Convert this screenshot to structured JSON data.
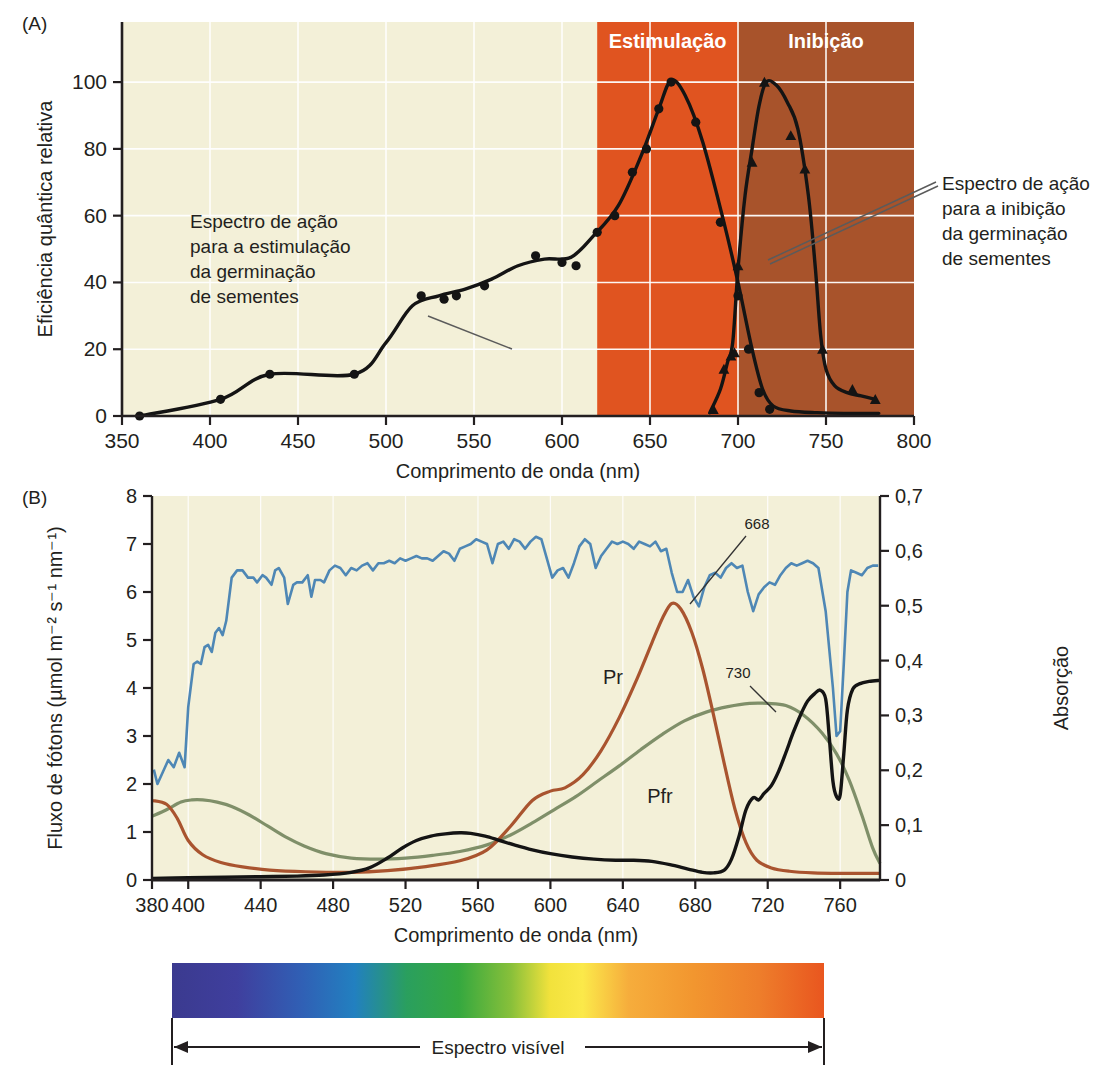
{
  "panelA": {
    "tag": "(A)",
    "ylabel": "Eficiência quântica relativa",
    "xlabel": "Comprimento de onda  (nm)",
    "xticks": [
      350,
      400,
      450,
      500,
      550,
      600,
      650,
      700,
      750,
      800
    ],
    "yticks": [
      0,
      20,
      40,
      60,
      80,
      100
    ],
    "xlim": [
      350,
      800
    ],
    "ylim": [
      0,
      118
    ],
    "bands": [
      {
        "label": "Estimulação",
        "from": 620,
        "to": 700,
        "color": "#e05420"
      },
      {
        "label": "Inibição",
        "from": 700,
        "to": 800,
        "color": "#a8532b"
      }
    ],
    "annotation_left": "Espectro de ação\npara a estimulação\nda germinação\nde sementes",
    "annotation_right": "Espectro de ação\npara a inibição\nda germinação\nde sementes",
    "stimulation_points": [
      [
        360,
        0
      ],
      [
        406,
        5
      ],
      [
        434,
        12.5
      ],
      [
        482,
        12.5
      ],
      [
        520,
        36
      ],
      [
        533,
        35
      ],
      [
        540,
        36
      ],
      [
        556,
        39
      ],
      [
        585,
        48
      ],
      [
        600,
        46
      ],
      [
        608,
        45
      ],
      [
        620,
        55
      ],
      [
        630,
        60
      ],
      [
        640,
        73
      ],
      [
        648,
        80
      ],
      [
        655,
        92
      ],
      [
        662,
        100
      ],
      [
        676,
        88
      ],
      [
        690,
        58
      ],
      [
        700,
        36
      ],
      [
        706,
        20
      ],
      [
        712,
        7
      ],
      [
        718,
        2
      ]
    ],
    "stimulation_curve": [
      [
        360,
        0
      ],
      [
        406,
        5
      ],
      [
        434,
        12.5
      ],
      [
        482,
        12.5
      ],
      [
        500,
        22
      ],
      [
        515,
        33
      ],
      [
        530,
        36
      ],
      [
        545,
        38
      ],
      [
        560,
        41
      ],
      [
        575,
        45
      ],
      [
        590,
        47
      ],
      [
        605,
        47.5
      ],
      [
        618,
        54
      ],
      [
        632,
        63
      ],
      [
        645,
        78
      ],
      [
        655,
        92
      ],
      [
        662,
        100.5
      ],
      [
        670,
        96
      ],
      [
        680,
        82
      ],
      [
        692,
        58
      ],
      [
        700,
        40
      ],
      [
        708,
        20
      ],
      [
        714,
        8
      ],
      [
        720,
        3
      ],
      [
        730,
        1.5
      ],
      [
        745,
        1
      ],
      [
        760,
        0.8
      ],
      [
        780,
        0.8
      ]
    ],
    "inhibition_points": [
      [
        686,
        2
      ],
      [
        692,
        14
      ],
      [
        696,
        18
      ],
      [
        698,
        19
      ],
      [
        700,
        45
      ],
      [
        708,
        76
      ],
      [
        715,
        100
      ],
      [
        730,
        84
      ],
      [
        738,
        74
      ],
      [
        748,
        20
      ],
      [
        765,
        8
      ],
      [
        778,
        5
      ]
    ],
    "inhibition_curve": [
      [
        684,
        1
      ],
      [
        690,
        8
      ],
      [
        694,
        16
      ],
      [
        697,
        22
      ],
      [
        700,
        44
      ],
      [
        704,
        66
      ],
      [
        708,
        80
      ],
      [
        712,
        93
      ],
      [
        716,
        100
      ],
      [
        722,
        99
      ],
      [
        728,
        94
      ],
      [
        734,
        86
      ],
      [
        740,
        66
      ],
      [
        744,
        44
      ],
      [
        747,
        24
      ],
      [
        750,
        14
      ],
      [
        755,
        9
      ],
      [
        762,
        7
      ],
      [
        770,
        6
      ],
      [
        778,
        5
      ]
    ]
  },
  "panelB": {
    "tag": "(B)",
    "ylabel_left": "Fluxo de fótons (µmol m⁻² s⁻¹ nm⁻¹)",
    "ylabel_right": "Absorção",
    "xlabel": "Comprimento de onda (nm)",
    "xticks": [
      380,
      400,
      440,
      480,
      520,
      560,
      600,
      640,
      680,
      720,
      760
    ],
    "xticks_labeled": [
      380,
      400,
      440,
      480,
      520,
      560,
      600,
      640,
      680,
      720,
      760
    ],
    "yticks_left": [
      0,
      1,
      2,
      3,
      4,
      5,
      6,
      7,
      8
    ],
    "yticks_right": [
      "0",
      "0,1",
      "0,2",
      "0,3",
      "0,4",
      "0,5",
      "0,6",
      "0,7"
    ],
    "xlim": [
      380,
      782
    ],
    "ylim_left": [
      0,
      8
    ],
    "ylim_right": [
      0,
      0.7
    ],
    "series_labels": {
      "pr": "Pr",
      "pfr": "Pfr"
    },
    "peak_labels": {
      "pr_peak": "668",
      "pfr_peak": "730"
    },
    "colors": {
      "sunlight": "#4e87b5",
      "pr": "#a9542f",
      "pfr": "#7f8f69",
      "black": "#141414"
    },
    "sunlight": [
      [
        381,
        2.3
      ],
      [
        383,
        2.0
      ],
      [
        386,
        2.25
      ],
      [
        389,
        2.5
      ],
      [
        392,
        2.35
      ],
      [
        395,
        2.65
      ],
      [
        398,
        2.35
      ],
      [
        400,
        3.6
      ],
      [
        403,
        4.5
      ],
      [
        405,
        4.55
      ],
      [
        407,
        4.5
      ],
      [
        409,
        4.85
      ],
      [
        411,
        4.9
      ],
      [
        413,
        4.75
      ],
      [
        415,
        5.15
      ],
      [
        417,
        5.25
      ],
      [
        419,
        5.1
      ],
      [
        421,
        5.4
      ],
      [
        424,
        6.3
      ],
      [
        427,
        6.45
      ],
      [
        430,
        6.45
      ],
      [
        433,
        6.3
      ],
      [
        436,
        6.3
      ],
      [
        438,
        6.2
      ],
      [
        441,
        6.35
      ],
      [
        443,
        6.3
      ],
      [
        446,
        6.15
      ],
      [
        448,
        6.45
      ],
      [
        450,
        6.5
      ],
      [
        453,
        6.3
      ],
      [
        455,
        5.75
      ],
      [
        458,
        6.15
      ],
      [
        460,
        6.2
      ],
      [
        463,
        6.2
      ],
      [
        466,
        6.35
      ],
      [
        468,
        5.9
      ],
      [
        470,
        6.25
      ],
      [
        473,
        6.25
      ],
      [
        475,
        6.2
      ],
      [
        478,
        6.45
      ],
      [
        481,
        6.55
      ],
      [
        484,
        6.5
      ],
      [
        487,
        6.35
      ],
      [
        490,
        6.5
      ],
      [
        493,
        6.45
      ],
      [
        496,
        6.55
      ],
      [
        499,
        6.6
      ],
      [
        502,
        6.45
      ],
      [
        505,
        6.6
      ],
      [
        508,
        6.6
      ],
      [
        511,
        6.65
      ],
      [
        514,
        6.6
      ],
      [
        517,
        6.7
      ],
      [
        520,
        6.65
      ],
      [
        523,
        6.7
      ],
      [
        526,
        6.75
      ],
      [
        529,
        6.7
      ],
      [
        532,
        6.7
      ],
      [
        535,
        6.65
      ],
      [
        538,
        6.75
      ],
      [
        541,
        6.85
      ],
      [
        544,
        6.8
      ],
      [
        547,
        6.65
      ],
      [
        550,
        6.9
      ],
      [
        553,
        6.95
      ],
      [
        556,
        7.0
      ],
      [
        559,
        7.1
      ],
      [
        562,
        7.05
      ],
      [
        565,
        7.0
      ],
      [
        568,
        6.6
      ],
      [
        571,
        7.0
      ],
      [
        574,
        7.05
      ],
      [
        577,
        6.9
      ],
      [
        580,
        7.1
      ],
      [
        583,
        7.05
      ],
      [
        586,
        6.9
      ],
      [
        589,
        7.05
      ],
      [
        592,
        7.15
      ],
      [
        595,
        7.1
      ],
      [
        598,
        6.7
      ],
      [
        601,
        6.3
      ],
      [
        604,
        6.45
      ],
      [
        607,
        6.5
      ],
      [
        610,
        6.3
      ],
      [
        613,
        6.6
      ],
      [
        616,
        6.95
      ],
      [
        619,
        7.1
      ],
      [
        622,
        7.0
      ],
      [
        625,
        6.5
      ],
      [
        628,
        6.75
      ],
      [
        631,
        6.9
      ],
      [
        634,
        7.05
      ],
      [
        637,
        7.0
      ],
      [
        640,
        7.05
      ],
      [
        643,
        7.0
      ],
      [
        646,
        6.9
      ],
      [
        649,
        7.05
      ],
      [
        652,
        7.0
      ],
      [
        655,
        6.95
      ],
      [
        658,
        7.05
      ],
      [
        661,
        6.85
      ],
      [
        664,
        6.9
      ],
      [
        667,
        6.4
      ],
      [
        670,
        6.0
      ],
      [
        673,
        6.0
      ],
      [
        676,
        6.25
      ],
      [
        679,
        5.9
      ],
      [
        682,
        5.7
      ],
      [
        685,
        6.1
      ],
      [
        688,
        6.35
      ],
      [
        691,
        6.4
      ],
      [
        694,
        6.3
      ],
      [
        697,
        6.5
      ],
      [
        700,
        6.6
      ],
      [
        703,
        6.5
      ],
      [
        706,
        6.55
      ],
      [
        709,
        6.0
      ],
      [
        712,
        5.6
      ],
      [
        715,
        5.95
      ],
      [
        718,
        6.1
      ],
      [
        721,
        6.2
      ],
      [
        724,
        6.15
      ],
      [
        727,
        6.35
      ],
      [
        730,
        6.5
      ],
      [
        733,
        6.6
      ],
      [
        736,
        6.55
      ],
      [
        739,
        6.6
      ],
      [
        742,
        6.65
      ],
      [
        745,
        6.6
      ],
      [
        748,
        6.5
      ],
      [
        752,
        5.6
      ],
      [
        756,
        4.0
      ],
      [
        758,
        3.0
      ],
      [
        760,
        3.1
      ],
      [
        762,
        4.5
      ],
      [
        764,
        6.0
      ],
      [
        766,
        6.45
      ],
      [
        769,
        6.4
      ],
      [
        772,
        6.35
      ],
      [
        775,
        6.5
      ],
      [
        778,
        6.55
      ],
      [
        781,
        6.55
      ]
    ],
    "pr": [
      [
        380,
        0.145
      ],
      [
        388,
        0.138
      ],
      [
        394,
        0.112
      ],
      [
        400,
        0.072
      ],
      [
        408,
        0.046
      ],
      [
        418,
        0.032
      ],
      [
        430,
        0.024
      ],
      [
        445,
        0.018
      ],
      [
        465,
        0.015
      ],
      [
        490,
        0.014
      ],
      [
        510,
        0.017
      ],
      [
        530,
        0.024
      ],
      [
        550,
        0.035
      ],
      [
        565,
        0.055
      ],
      [
        578,
        0.098
      ],
      [
        590,
        0.145
      ],
      [
        600,
        0.162
      ],
      [
        608,
        0.168
      ],
      [
        618,
        0.192
      ],
      [
        628,
        0.236
      ],
      [
        638,
        0.296
      ],
      [
        648,
        0.368
      ],
      [
        656,
        0.432
      ],
      [
        662,
        0.478
      ],
      [
        667,
        0.504
      ],
      [
        672,
        0.494
      ],
      [
        678,
        0.452
      ],
      [
        684,
        0.386
      ],
      [
        690,
        0.302
      ],
      [
        696,
        0.212
      ],
      [
        702,
        0.128
      ],
      [
        708,
        0.068
      ],
      [
        714,
        0.036
      ],
      [
        722,
        0.022
      ],
      [
        732,
        0.016
      ],
      [
        745,
        0.013
      ],
      [
        760,
        0.012
      ],
      [
        775,
        0.012
      ],
      [
        782,
        0.012
      ]
    ],
    "pfr": [
      [
        380,
        0.116
      ],
      [
        388,
        0.128
      ],
      [
        396,
        0.142
      ],
      [
        402,
        0.146
      ],
      [
        408,
        0.146
      ],
      [
        416,
        0.142
      ],
      [
        424,
        0.134
      ],
      [
        434,
        0.118
      ],
      [
        444,
        0.098
      ],
      [
        454,
        0.078
      ],
      [
        464,
        0.062
      ],
      [
        476,
        0.048
      ],
      [
        490,
        0.04
      ],
      [
        505,
        0.038
      ],
      [
        520,
        0.04
      ],
      [
        535,
        0.045
      ],
      [
        550,
        0.052
      ],
      [
        565,
        0.064
      ],
      [
        578,
        0.082
      ],
      [
        590,
        0.104
      ],
      [
        602,
        0.128
      ],
      [
        614,
        0.152
      ],
      [
        626,
        0.18
      ],
      [
        638,
        0.208
      ],
      [
        650,
        0.238
      ],
      [
        662,
        0.266
      ],
      [
        674,
        0.29
      ],
      [
        686,
        0.306
      ],
      [
        698,
        0.316
      ],
      [
        710,
        0.322
      ],
      [
        720,
        0.322
      ],
      [
        730,
        0.318
      ],
      [
        740,
        0.3
      ],
      [
        750,
        0.268
      ],
      [
        758,
        0.23
      ],
      [
        765,
        0.182
      ],
      [
        772,
        0.118
      ],
      [
        778,
        0.058
      ],
      [
        782,
        0.03
      ]
    ],
    "black": [
      [
        380,
        0.003
      ],
      [
        400,
        0.004
      ],
      [
        420,
        0.005
      ],
      [
        440,
        0.006
      ],
      [
        460,
        0.007
      ],
      [
        475,
        0.009
      ],
      [
        490,
        0.014
      ],
      [
        500,
        0.022
      ],
      [
        510,
        0.04
      ],
      [
        518,
        0.058
      ],
      [
        526,
        0.072
      ],
      [
        534,
        0.08
      ],
      [
        542,
        0.084
      ],
      [
        550,
        0.086
      ],
      [
        556,
        0.085
      ],
      [
        564,
        0.08
      ],
      [
        572,
        0.072
      ],
      [
        580,
        0.064
      ],
      [
        590,
        0.055
      ],
      [
        600,
        0.048
      ],
      [
        612,
        0.042
      ],
      [
        624,
        0.038
      ],
      [
        636,
        0.036
      ],
      [
        646,
        0.036
      ],
      [
        656,
        0.034
      ],
      [
        666,
        0.028
      ],
      [
        676,
        0.02
      ],
      [
        684,
        0.014
      ],
      [
        690,
        0.013
      ],
      [
        696,
        0.018
      ],
      [
        700,
        0.038
      ],
      [
        704,
        0.078
      ],
      [
        708,
        0.128
      ],
      [
        712,
        0.15
      ],
      [
        715,
        0.146
      ],
      [
        718,
        0.158
      ],
      [
        722,
        0.172
      ],
      [
        726,
        0.198
      ],
      [
        730,
        0.232
      ],
      [
        734,
        0.268
      ],
      [
        738,
        0.3
      ],
      [
        742,
        0.326
      ],
      [
        746,
        0.34
      ],
      [
        749,
        0.346
      ],
      [
        752,
        0.33
      ],
      [
        754,
        0.26
      ],
      [
        756,
        0.18
      ],
      [
        758,
        0.152
      ],
      [
        760,
        0.155
      ],
      [
        762,
        0.23
      ],
      [
        764,
        0.31
      ],
      [
        767,
        0.348
      ],
      [
        771,
        0.358
      ],
      [
        776,
        0.362
      ],
      [
        782,
        0.364
      ]
    ]
  },
  "spectrum": {
    "label": "Espectro visível",
    "stops": [
      {
        "pos": 0,
        "color": "#3b3a8f"
      },
      {
        "pos": 0.1,
        "color": "#3f3f9e"
      },
      {
        "pos": 0.2,
        "color": "#3060b5"
      },
      {
        "pos": 0.28,
        "color": "#2280c0"
      },
      {
        "pos": 0.36,
        "color": "#2a9f5e"
      },
      {
        "pos": 0.44,
        "color": "#35a83f"
      },
      {
        "pos": 0.52,
        "color": "#88c03a"
      },
      {
        "pos": 0.58,
        "color": "#f2e23c"
      },
      {
        "pos": 0.63,
        "color": "#fbe94a"
      },
      {
        "pos": 0.7,
        "color": "#f6ad3c"
      },
      {
        "pos": 0.8,
        "color": "#f2962f"
      },
      {
        "pos": 0.9,
        "color": "#ee7e2b"
      },
      {
        "pos": 1,
        "color": "#e9561f"
      }
    ]
  },
  "style": {
    "plot_bg": "#f3f0d8",
    "grid": "#ffffff",
    "ink": "#231f20"
  }
}
